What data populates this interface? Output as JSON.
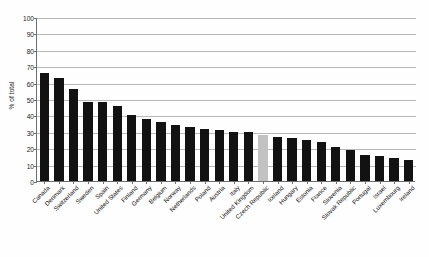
{
  "chart_data": {
    "type": "bar",
    "title": "",
    "subtitle": "",
    "xlabel": "",
    "ylabel": "% of total",
    "ylim": [
      0,
      100
    ],
    "ytick_step": 10,
    "yticks": [
      0,
      10,
      20,
      30,
      40,
      50,
      60,
      70,
      80,
      90,
      100
    ],
    "grid": true,
    "legend": "none",
    "bar_color": "#121212",
    "highlight_color": "#c2c2c2",
    "highlight_category": "Czech Republic",
    "categories": [
      "Canada",
      "Denmark",
      "Switzerland",
      "Sweden",
      "Spain",
      "United States",
      "Finland",
      "Germany",
      "Belgium",
      "Norway",
      "Netherlands",
      "Poland",
      "Austria",
      "Italy",
      "United Kingdom",
      "Czech Republic",
      "Iceland",
      "Hungary",
      "Estonia",
      "France",
      "Slovenia",
      "Slovak Republic",
      "Portugal",
      "Israel",
      "Luxembourg",
      "Ireland"
    ],
    "values": [
      66,
      63,
      56,
      48,
      48,
      46,
      40,
      38,
      36,
      34,
      33,
      32,
      31,
      30,
      30,
      28,
      27,
      26,
      25,
      24,
      21,
      19,
      16,
      15,
      14,
      13
    ]
  }
}
